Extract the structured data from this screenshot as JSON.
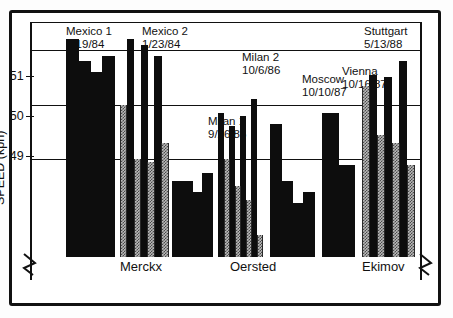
{
  "axis": {
    "y_title": "SPEED (kph)",
    "ticks": [
      "51",
      "50",
      "49"
    ]
  },
  "riders": [
    {
      "name": "Merckx"
    },
    {
      "name": "Oersted"
    },
    {
      "name": "Ekimov"
    }
  ],
  "annotations": [
    {
      "line1": "Mexico    1",
      "line2": "1/19/84"
    },
    {
      "line1": "Mexico    2",
      "line2": "1/23/84"
    },
    {
      "line1": "Milan    1",
      "line2": "9/26/86"
    },
    {
      "line1": "Milan    2",
      "line2": "10/6/86"
    },
    {
      "line1": "Moscow",
      "line2": "10/10/87"
    },
    {
      "line1": "Vienna",
      "line2": "10/16/87"
    },
    {
      "line1": "Stuttgart",
      "line2": "5/13/88"
    }
  ],
  "colors": {
    "black_fill": "#0d0d0d",
    "gray_fill": "#b9b9b9",
    "axis": "#111111",
    "background": "#ffffff"
  },
  "chart_data": {
    "type": "bar",
    "title": "",
    "subtitle": "",
    "xlabel": "",
    "ylabel": "SPEED (kph)",
    "ylim": [
      47.2,
      51.5
    ],
    "yticks": [
      49,
      50,
      51
    ],
    "grid": true,
    "legend_position": "none",
    "axis_break": "y-axis broken below 48.8; bars truncated at plot floor",
    "group_label_note": "Rider names Merckx, Oersted and Ekimov span the groups beneath the bars",
    "categories": [
      "Mexico 1\n1/19/84",
      "Mexico 2\n1/23/84",
      "Milan 1\n9/26/86",
      "Milan 2\n10/6/86",
      "Moscow\n10/10/87",
      "Vienna\n10/16/87",
      "Stuttgart\n5/13/88"
    ],
    "groups": [
      {
        "label": "Mexico 1",
        "date": "1/19/84",
        "rider": "Merckx",
        "bars": [
          {
            "fill": "black",
            "value": 51.2
          },
          {
            "fill": "black",
            "value": 50.8
          },
          {
            "fill": "black",
            "value": 50.6
          },
          {
            "fill": "black",
            "value": 50.9
          }
        ]
      },
      {
        "label": "Mexico 2",
        "date": "1/23/84",
        "rider": "Merckx",
        "bars": [
          {
            "fill": "gray",
            "value": 50.0
          },
          {
            "fill": "black",
            "value": 51.2
          },
          {
            "fill": "gray",
            "value": 49.0
          },
          {
            "fill": "black",
            "value": 51.1
          },
          {
            "fill": "gray",
            "value": 48.95
          },
          {
            "fill": "black",
            "value": 50.9
          },
          {
            "fill": "gray",
            "value": 49.3
          }
        ]
      },
      {
        "label": "Milan 1",
        "date": "9/26/86",
        "rider": "Oersted",
        "bars": [
          {
            "fill": "black",
            "value": 48.6
          },
          {
            "fill": "black",
            "value": 48.6
          },
          {
            "fill": "black",
            "value": 48.4
          },
          {
            "fill": "black",
            "value": 48.75
          }
        ]
      },
      {
        "label": "Milan 2",
        "date": "10/6/86",
        "rider": "Oersted",
        "bars": [
          {
            "fill": "black",
            "value": 49.85
          },
          {
            "fill": "gray",
            "value": 49.0
          },
          {
            "fill": "black",
            "value": 49.6
          },
          {
            "fill": "gray",
            "value": 48.5
          },
          {
            "fill": "black",
            "value": 49.8
          },
          {
            "fill": "gray",
            "value": 48.25
          },
          {
            "fill": "black",
            "value": 50.1
          },
          {
            "fill": "gray",
            "value": 47.6
          }
        ]
      },
      {
        "label": "Moscow",
        "date": "10/10/87",
        "rider": "Oersted",
        "bars": [
          {
            "fill": "black",
            "value": 49.65
          },
          {
            "fill": "black",
            "value": 48.6
          },
          {
            "fill": "black",
            "value": 48.2
          },
          {
            "fill": "black",
            "value": 48.4
          }
        ]
      },
      {
        "label": "Vienna",
        "date": "10/16/87",
        "rider": "Ekimov",
        "bars": [
          {
            "fill": "black",
            "value": 49.85
          },
          {
            "fill": "black",
            "value": 48.9
          }
        ]
      },
      {
        "label": "Stuttgart",
        "date": "5/13/88",
        "rider": "Ekimov",
        "bars": [
          {
            "fill": "gray",
            "value": 50.35
          },
          {
            "fill": "black",
            "value": 50.55
          },
          {
            "fill": "gray",
            "value": 49.45
          },
          {
            "fill": "black",
            "value": 50.5
          },
          {
            "fill": "gray",
            "value": 49.3
          },
          {
            "fill": "black",
            "value": 50.8
          },
          {
            "fill": "gray",
            "value": 48.9
          }
        ]
      }
    ]
  },
  "layout": {
    "groups_px": [
      {
        "x": 34,
        "w": 48
      },
      {
        "x": 88,
        "w": 48
      },
      {
        "x": 140,
        "w": 40
      },
      {
        "x": 186,
        "w": 44
      },
      {
        "x": 238,
        "w": 44
      },
      {
        "x": 290,
        "w": 32
      },
      {
        "x": 330,
        "w": 52
      }
    ],
    "annot_px": [
      {
        "x": 34,
        "y": 2
      },
      {
        "x": 110,
        "y": 2
      },
      {
        "x": 176,
        "y": 92
      },
      {
        "x": 210,
        "y": 28
      },
      {
        "x": 270,
        "y": 50
      },
      {
        "x": 310,
        "y": 42
      },
      {
        "x": 332,
        "y": 2
      }
    ],
    "rider_px": [
      {
        "x": 88
      },
      {
        "x": 198
      },
      {
        "x": 330
      }
    ]
  }
}
